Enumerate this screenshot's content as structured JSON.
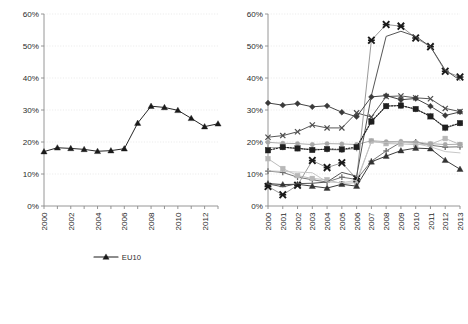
{
  "chart_data": [
    {
      "id": "left",
      "type": "line",
      "title": "",
      "xlabel": "",
      "ylabel": "",
      "x": [
        2000,
        2001,
        2002,
        2003,
        2004,
        2005,
        2006,
        2007,
        2008,
        2009,
        2010,
        2011,
        2012,
        2013
      ],
      "xtick_labels": [
        "2000",
        "",
        "2002",
        "",
        "2004",
        "",
        "2006",
        "",
        "2008",
        "",
        "2010",
        "",
        "2012",
        ""
      ],
      "xlim": [
        2000,
        2013
      ],
      "ylim": [
        0,
        60
      ],
      "ytick_labels": [
        "0%",
        "10%",
        "20%",
        "30%",
        "40%",
        "50%",
        "60%"
      ],
      "ytick_values": [
        0,
        10,
        20,
        30,
        40,
        50,
        60
      ],
      "grid": "horizontal-dotted",
      "legend_position": "bottom-center",
      "series": [
        {
          "name": "EU10",
          "marker": "triangle",
          "color": "#1a1a1a",
          "values": [
            17.0,
            18.2,
            18.0,
            17.7,
            17.1,
            17.3,
            17.9,
            25.9,
            31.2,
            30.8,
            29.9,
            27.4,
            24.8,
            25.7
          ]
        }
      ]
    },
    {
      "id": "right",
      "type": "line",
      "title": "",
      "xlabel": "",
      "ylabel": "",
      "x": [
        2000,
        2001,
        2002,
        2003,
        2004,
        2005,
        2006,
        2007,
        2008,
        2009,
        2010,
        2011,
        2012,
        2013
      ],
      "xtick_labels": [
        "2000",
        "2001",
        "2002",
        "2003",
        "2004",
        "2005",
        "2006",
        "2007",
        "2008",
        "2009",
        "2010",
        "2011",
        "2012",
        "2013"
      ],
      "xlim": [
        2000,
        2013
      ],
      "ylim": [
        0,
        60
      ],
      "ytick_labels": [
        "0%",
        "10%",
        "20%",
        "30%",
        "40%",
        "50%",
        "60%"
      ],
      "ytick_values": [
        0,
        10,
        20,
        30,
        40,
        50,
        60
      ],
      "grid": "horizontal-dotted",
      "legend_position": "bottom",
      "series": [
        {
          "name": "BG",
          "marker": "plus",
          "color": "#6e6e6e",
          "values": [
            10.9,
            10.5,
            9.0,
            8.2,
            7.5,
            9.0,
            8.3,
            14.0,
            17.2,
            19.9,
            20.0,
            19.0,
            18.4,
            18.5
          ]
        },
        {
          "name": "CZ",
          "marker": "square",
          "color": "#b8b8b8",
          "values": [
            14.8,
            11.7,
            9.5,
            8.6,
            8.2,
            7.0,
            7.3,
            20.3,
            19.5,
            19.4,
            19.2,
            19.3,
            21.1,
            19.2
          ]
        },
        {
          "name": "EE",
          "marker": "triangle",
          "color": "#333333",
          "values": [
            7.0,
            6.7,
            6.8,
            6.2,
            5.6,
            6.8,
            6.2,
            13.8,
            15.6,
            17.3,
            18.1,
            17.9,
            14.3,
            11.5
          ]
        },
        {
          "name": "HU",
          "marker": "x",
          "color": "#4d4d4d",
          "values": [
            21.5,
            22.0,
            23.2,
            25.3,
            24.4,
            24.4,
            29.1,
            27.8,
            34.2,
            34.4,
            33.8,
            33.5,
            30.5,
            29.5
          ]
        },
        {
          "name": "LT",
          "marker": "x-bold",
          "color": "#9a9a9a",
          "values": [
            6.1,
            3.5,
            6.5,
            14.2,
            12.0,
            13.5,
            8.5,
            51.8,
            56.7,
            56.2,
            52.5,
            49.8,
            42.1,
            40.3
          ]
        },
        {
          "name": "LV",
          "marker": "circle",
          "color": "#a8a8a8",
          "values": [
            19.9,
            19.6,
            19.5,
            19.2,
            19.5,
            19.4,
            19.2,
            20.4,
            20.1,
            20.2,
            19.9,
            19.5,
            19.2,
            19.3
          ]
        },
        {
          "name": "PL",
          "marker": "plus-light",
          "color": "#9e9e9e",
          "values": [
            18.2,
            18.3,
            18.0,
            17.8,
            17.6,
            17.5,
            18.0,
            26.3,
            31.3,
            31.4,
            30.2,
            28.2,
            24.3,
            25.8
          ]
        },
        {
          "name": "RO",
          "marker": "none",
          "color": "#555555",
          "values": [
            6.9,
            6.0,
            7.0,
            7.1,
            7.5,
            10.5,
            9.3,
            34.5,
            53.0,
            54.6,
            53.0,
            49.8,
            42.5,
            39.3
          ]
        },
        {
          "name": "SI",
          "marker": "none-light",
          "color": "#c4c4c4",
          "values": [
            11.0,
            10.8,
            10.6,
            10.4,
            7.5,
            7.3,
            8.0,
            20.0,
            19.8,
            20.0,
            19.5,
            18.5,
            17.0,
            16.6
          ]
        },
        {
          "name": "SK",
          "marker": "diamond",
          "color": "#3a3a3a",
          "values": [
            32.2,
            31.5,
            32.0,
            31.0,
            31.3,
            29.3,
            27.9,
            34.1,
            34.5,
            33.2,
            33.6,
            31.2,
            28.3,
            29.4
          ]
        },
        {
          "name": "EU10",
          "marker": "square-dotted",
          "color": "#1f1f1f",
          "values": [
            17.4,
            18.4,
            18.0,
            17.5,
            17.8,
            17.7,
            18.4,
            26.4,
            31.2,
            31.4,
            30.3,
            28.0,
            24.5,
            25.9
          ]
        }
      ]
    }
  ],
  "legend_left": {
    "items": [
      {
        "label": "EU10",
        "marker": "triangle"
      }
    ]
  },
  "legend_right": {
    "items": [
      {
        "label": "BG",
        "marker": "plus"
      },
      {
        "label": "CZ",
        "marker": "square"
      },
      {
        "label": "EE",
        "marker": "triangle"
      },
      {
        "label": "HU",
        "marker": "x"
      },
      {
        "label": "LT",
        "marker": "x-bold"
      },
      {
        "label": "LV",
        "marker": "circle"
      },
      {
        "label": "PL",
        "marker": "plus-light"
      },
      {
        "label": "RO",
        "marker": "none"
      },
      {
        "label": "SI",
        "marker": "none-light"
      },
      {
        "label": "SK",
        "marker": "diamond"
      },
      {
        "label": "EU10",
        "marker": "square-dotted"
      }
    ]
  },
  "colors": {
    "axis": "#8a8a8a",
    "grid": "#e2e2e2",
    "text": "#2b2b2b",
    "background": "#ffffff"
  }
}
